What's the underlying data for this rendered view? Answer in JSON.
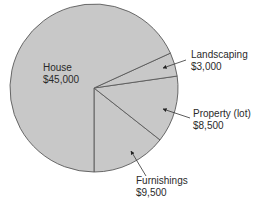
{
  "chart_data": {
    "type": "pie",
    "title": "",
    "total": 66000,
    "slices": [
      {
        "label": "House",
        "value": 45000,
        "display_value": "$45,000",
        "color": "#c8c8c8"
      },
      {
        "label": "Landscaping",
        "value": 3000,
        "display_value": "$3,000",
        "color": "#c8c8c8"
      },
      {
        "label": "Property (lot)",
        "value": 8500,
        "display_value": "$8,500",
        "color": "#c8c8c8"
      },
      {
        "label": "Furnishings",
        "value": 9500,
        "display_value": "$9,500",
        "color": "#c8c8c8"
      }
    ],
    "legend": "none (callout labels with arrows)"
  },
  "style": {
    "slice_fill": "#c8c8c8",
    "edge_color": "#5a5a5a",
    "text_color": "#2a2a2a"
  },
  "labels": {
    "house": {
      "name": "House",
      "value": "$45,000"
    },
    "landscaping": {
      "name": "Landscaping",
      "value": "$3,000"
    },
    "property": {
      "name": "Property (lot)",
      "value": "$8,500"
    },
    "furnishings": {
      "name": "Furnishings",
      "value": "$9,500"
    }
  }
}
